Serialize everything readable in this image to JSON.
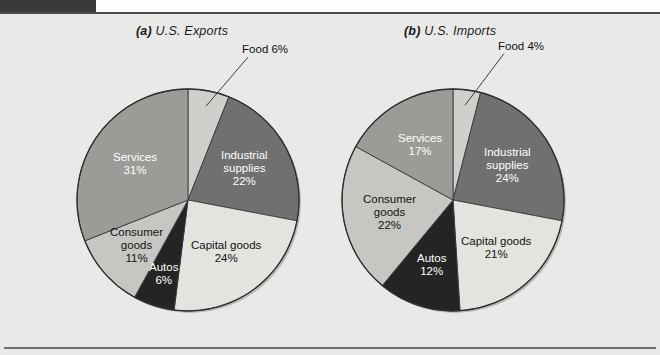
{
  "figure": {
    "background_color": "#e9e9e7",
    "tab_color": "#3a3a3a",
    "rule_color": "#4a4a4a"
  },
  "charts": [
    {
      "id": "us-exports",
      "tag": "(a)",
      "title": "U.S. Exports",
      "center": [
        188,
        200
      ],
      "radius": 111,
      "slices": [
        {
          "name": "Food",
          "label": "Food",
          "value": 6,
          "value_label": "6%",
          "color": "#cfcfcb",
          "label_style": "external"
        },
        {
          "name": "Industrial supplies",
          "label": "Industrial\nsupplies",
          "value": 22,
          "value_label": "22%",
          "color": "#707070",
          "label_style": "light"
        },
        {
          "name": "Capital goods",
          "label": "Capital goods",
          "value": 24,
          "value_label": "24%",
          "color": "#e3e3df",
          "label_style": "dark"
        },
        {
          "name": "Autos",
          "label": "Autos",
          "value": 6,
          "value_label": "6%",
          "color": "#242424",
          "label_style": "light"
        },
        {
          "name": "Consumer goods",
          "label": "Consumer\ngoods",
          "value": 11,
          "value_label": "11%",
          "color": "#c6c6c2",
          "label_style": "dark"
        },
        {
          "name": "Services",
          "label": "Services",
          "value": 31,
          "value_label": "31%",
          "color": "#9b9b97",
          "label_style": "light"
        }
      ]
    },
    {
      "id": "us-imports",
      "tag": "(b)",
      "title": "U.S. Imports",
      "center": [
        453,
        200
      ],
      "radius": 111,
      "slices": [
        {
          "name": "Food",
          "label": "Food",
          "value": 4,
          "value_label": "4%",
          "color": "#cfcfcb",
          "label_style": "external"
        },
        {
          "name": "Industrial supplies",
          "label": "Industrial\nsupplies",
          "value": 24,
          "value_label": "24%",
          "color": "#707070",
          "label_style": "light"
        },
        {
          "name": "Capital goods",
          "label": "Capital goods",
          "value": 21,
          "value_label": "21%",
          "color": "#e3e3df",
          "label_style": "dark"
        },
        {
          "name": "Autos",
          "label": "Autos",
          "value": 12,
          "value_label": "12%",
          "color": "#242424",
          "label_style": "light"
        },
        {
          "name": "Consumer goods",
          "label": "Consumer\ngoods",
          "value": 22,
          "value_label": "22%",
          "color": "#c6c6c2",
          "label_style": "dark"
        },
        {
          "name": "Services",
          "label": "Services",
          "value": 17,
          "value_label": "17%",
          "color": "#9b9b97",
          "label_style": "light"
        }
      ]
    }
  ],
  "chart_data": [
    {
      "type": "pie",
      "title": "(a) U.S. Exports",
      "labels": [
        "Food",
        "Industrial supplies",
        "Capital goods",
        "Autos",
        "Consumer goods",
        "Services"
      ],
      "values": [
        6,
        22,
        24,
        6,
        11,
        31
      ],
      "value_labels": [
        "6%",
        "22%",
        "24%",
        "6%",
        "11%",
        "31%"
      ],
      "colors": [
        "#cfcfcb",
        "#707070",
        "#e3e3df",
        "#242424",
        "#c6c6c2",
        "#9b9b97"
      ],
      "units": "percent",
      "start_angle_deg": 0,
      "direction": "clockwise",
      "legend": "none",
      "grid": false
    },
    {
      "type": "pie",
      "title": "(b) U.S. Imports",
      "labels": [
        "Food",
        "Industrial supplies",
        "Capital goods",
        "Autos",
        "Consumer goods",
        "Services"
      ],
      "values": [
        4,
        24,
        21,
        12,
        22,
        17
      ],
      "value_labels": [
        "4%",
        "24%",
        "21%",
        "12%",
        "22%",
        "17%"
      ],
      "colors": [
        "#cfcfcb",
        "#707070",
        "#e3e3df",
        "#242424",
        "#c6c6c2",
        "#9b9b97"
      ],
      "units": "percent",
      "start_angle_deg": 0,
      "direction": "clockwise",
      "legend": "none",
      "grid": false
    }
  ]
}
